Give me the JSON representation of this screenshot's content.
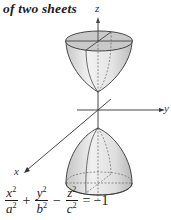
{
  "title": "of two sheets",
  "axes": {
    "x_label": "x",
    "y_label": "y",
    "z_label": "z"
  },
  "surface": {
    "name": "hyperboloid of two sheets",
    "sheets": [
      "upper",
      "lower"
    ]
  },
  "equation": {
    "term1": {
      "num": "x",
      "den": "a"
    },
    "op1": "+",
    "term2": {
      "num": "y",
      "den": "b"
    },
    "op2": "−",
    "term3": {
      "num": "z",
      "den": "c"
    },
    "exponent": "2",
    "equals": "=",
    "rhs": "−1"
  },
  "colors": {
    "ink": "#1a1a1a",
    "surface_fill": "#d9d9d9",
    "surface_light": "#efefef",
    "cap_fill": "#bdbdbd"
  }
}
